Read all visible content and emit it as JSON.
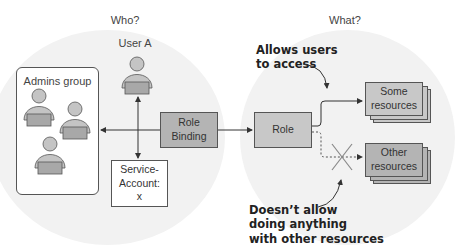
{
  "headings": {
    "who": "Who?",
    "what": "What?"
  },
  "subjects": {
    "user_a": "User A",
    "admins_group": "Admins group",
    "service_account": [
      "Service-",
      "Account:",
      "x"
    ]
  },
  "binding": {
    "line1": "Role",
    "line2": "Binding"
  },
  "role": {
    "label": "Role"
  },
  "resources": {
    "some": [
      "Some",
      "resources"
    ],
    "other": [
      "Other",
      "resources"
    ]
  },
  "notes": {
    "allows": [
      "Allows users",
      "to access"
    ],
    "denies": [
      "Doesn’t allow",
      "doing anything",
      "with other resources"
    ]
  },
  "colors": {
    "box_fill": "#c8c8c8",
    "binding_fill": "#b4b4b4",
    "circle_bg": "#f2f2f2",
    "person": "#c4c4c4"
  }
}
